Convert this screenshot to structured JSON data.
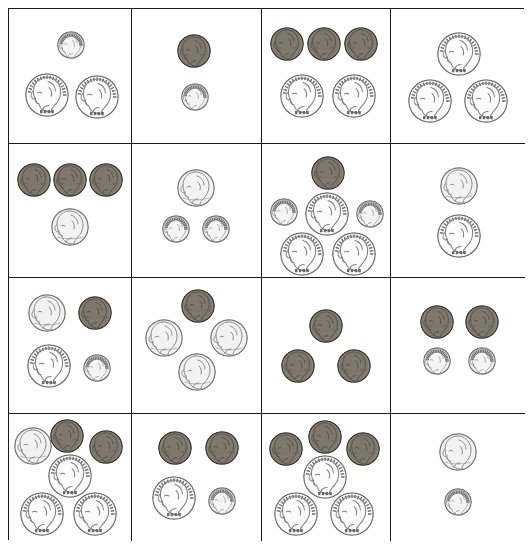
{
  "page": {
    "grid": {
      "rows": 4,
      "cols": 4
    }
  },
  "colors": {
    "border": "#1a1a1a",
    "background": "#ffffff",
    "quarter_face": "#fbfbfb",
    "quarter_edge": "#6b6b6b",
    "nickel_face": "#f2f2f2",
    "nickel_edge": "#6e6e6e",
    "dime_face": "#f4f4f4",
    "dime_edge": "#707070",
    "penny_face": "#8a8378",
    "penny_edge": "#3a362f",
    "relief": "#9a9a9a"
  },
  "coin_types": {
    "quarter": {
      "label": "quarter",
      "value_cents": 25,
      "diameter_px": 44,
      "portrait": "Washington",
      "edge": "reeded"
    },
    "nickel": {
      "label": "nickel",
      "value_cents": 5,
      "diameter_px": 38,
      "portrait": "Jefferson",
      "edge": "smooth"
    },
    "penny": {
      "label": "penny",
      "value_cents": 1,
      "diameter_px": 34,
      "portrait": "Lincoln",
      "edge": "smooth"
    },
    "dime": {
      "label": "dime",
      "value_cents": 10,
      "diameter_px": 28,
      "portrait": "Roosevelt",
      "edge": "reeded"
    }
  },
  "cells": [
    {
      "row": 1,
      "col": 1,
      "name": "cell-r1c1",
      "total_cents": 60,
      "coins": [
        {
          "type": "dime",
          "x": 62,
          "y": 36
        },
        {
          "type": "quarter",
          "x": 38,
          "y": 86
        },
        {
          "type": "quarter",
          "x": 88,
          "y": 88
        }
      ]
    },
    {
      "row": 1,
      "col": 2,
      "name": "cell-r1c2",
      "total_cents": 11,
      "coins": [
        {
          "type": "penny",
          "x": 62,
          "y": 42
        },
        {
          "type": "dime",
          "x": 63,
          "y": 88
        }
      ]
    },
    {
      "row": 1,
      "col": 3,
      "name": "cell-r1c3",
      "total_cents": 53,
      "coins": [
        {
          "type": "penny",
          "x": 25,
          "y": 35
        },
        {
          "type": "penny",
          "x": 62,
          "y": 35
        },
        {
          "type": "penny",
          "x": 99,
          "y": 35
        },
        {
          "type": "quarter",
          "x": 40,
          "y": 87
        },
        {
          "type": "quarter",
          "x": 92,
          "y": 87
        }
      ]
    },
    {
      "row": 1,
      "col": 4,
      "name": "cell-r1c4",
      "total_cents": 75,
      "coins": [
        {
          "type": "quarter",
          "x": 68,
          "y": 45
        },
        {
          "type": "quarter",
          "x": 39,
          "y": 92
        },
        {
          "type": "quarter",
          "x": 95,
          "y": 92
        }
      ]
    },
    {
      "row": 2,
      "col": 1,
      "name": "cell-r2c1",
      "total_cents": 8,
      "coins": [
        {
          "type": "penny",
          "x": 25,
          "y": 36
        },
        {
          "type": "penny",
          "x": 61,
          "y": 36
        },
        {
          "type": "penny",
          "x": 97,
          "y": 36
        },
        {
          "type": "nickel",
          "x": 61,
          "y": 83
        }
      ]
    },
    {
      "row": 2,
      "col": 2,
      "name": "cell-r2c2",
      "total_cents": 25,
      "coins": [
        {
          "type": "nickel",
          "x": 64,
          "y": 44
        },
        {
          "type": "dime",
          "x": 44,
          "y": 85
        },
        {
          "type": "dime",
          "x": 84,
          "y": 85
        }
      ]
    },
    {
      "row": 2,
      "col": 3,
      "name": "cell-r2c3",
      "total_cents": 96,
      "coins": [
        {
          "type": "penny",
          "x": 66,
          "y": 29
        },
        {
          "type": "dime",
          "x": 22,
          "y": 68
        },
        {
          "type": "quarter",
          "x": 65,
          "y": 70
        },
        {
          "type": "dime",
          "x": 108,
          "y": 70
        },
        {
          "type": "quarter",
          "x": 40,
          "y": 110
        },
        {
          "type": "quarter",
          "x": 92,
          "y": 110
        }
      ]
    },
    {
      "row": 2,
      "col": 4,
      "name": "cell-r2c4",
      "total_cents": 30,
      "coins": [
        {
          "type": "nickel",
          "x": 68,
          "y": 42
        },
        {
          "type": "quarter",
          "x": 68,
          "y": 92
        }
      ]
    },
    {
      "row": 3,
      "col": 1,
      "name": "cell-r3c1",
      "total_cents": 41,
      "coins": [
        {
          "type": "nickel",
          "x": 38,
          "y": 35
        },
        {
          "type": "penny",
          "x": 86,
          "y": 35
        },
        {
          "type": "quarter",
          "x": 40,
          "y": 88
        },
        {
          "type": "dime",
          "x": 88,
          "y": 90
        }
      ]
    },
    {
      "row": 3,
      "col": 2,
      "name": "cell-r3c2",
      "total_cents": 16,
      "coins": [
        {
          "type": "penny",
          "x": 66,
          "y": 28
        },
        {
          "type": "nickel",
          "x": 32,
          "y": 60
        },
        {
          "type": "nickel",
          "x": 97,
          "y": 60
        },
        {
          "type": "nickel",
          "x": 65,
          "y": 94
        }
      ]
    },
    {
      "row": 3,
      "col": 3,
      "name": "cell-r3c3",
      "total_cents": 3,
      "coins": [
        {
          "type": "penny",
          "x": 64,
          "y": 48
        },
        {
          "type": "penny",
          "x": 36,
          "y": 88
        },
        {
          "type": "penny",
          "x": 92,
          "y": 88
        }
      ]
    },
    {
      "row": 3,
      "col": 4,
      "name": "cell-r3c4",
      "total_cents": 22,
      "coins": [
        {
          "type": "penny",
          "x": 46,
          "y": 44
        },
        {
          "type": "penny",
          "x": 91,
          "y": 44
        },
        {
          "type": "dime",
          "x": 46,
          "y": 83
        },
        {
          "type": "dime",
          "x": 91,
          "y": 83
        }
      ]
    },
    {
      "row": 4,
      "col": 1,
      "name": "cell-r4c1",
      "total_cents": 82,
      "coins": [
        {
          "type": "nickel",
          "x": 24,
          "y": 32
        },
        {
          "type": "penny",
          "x": 58,
          "y": 22
        },
        {
          "type": "penny",
          "x": 97,
          "y": 33
        },
        {
          "type": "quarter",
          "x": 61,
          "y": 62
        },
        {
          "type": "quarter",
          "x": 33,
          "y": 100
        },
        {
          "type": "quarter",
          "x": 86,
          "y": 100
        }
      ]
    },
    {
      "row": 4,
      "col": 2,
      "name": "cell-r4c2",
      "total_cents": 37,
      "coins": [
        {
          "type": "penny",
          "x": 43,
          "y": 34
        },
        {
          "type": "penny",
          "x": 90,
          "y": 34
        },
        {
          "type": "quarter",
          "x": 42,
          "y": 84
        },
        {
          "type": "dime",
          "x": 90,
          "y": 87
        }
      ]
    },
    {
      "row": 4,
      "col": 3,
      "name": "cell-r4c3",
      "total_cents": 78,
      "coins": [
        {
          "type": "penny",
          "x": 24,
          "y": 35
        },
        {
          "type": "penny",
          "x": 63,
          "y": 23
        },
        {
          "type": "penny",
          "x": 101,
          "y": 35
        },
        {
          "type": "quarter",
          "x": 63,
          "y": 63
        },
        {
          "type": "quarter",
          "x": 34,
          "y": 100
        },
        {
          "type": "quarter",
          "x": 90,
          "y": 100
        }
      ]
    },
    {
      "row": 4,
      "col": 4,
      "name": "cell-r4c4",
      "total_cents": 15,
      "coins": [
        {
          "type": "nickel",
          "x": 67,
          "y": 38
        },
        {
          "type": "dime",
          "x": 67,
          "y": 88
        }
      ]
    }
  ]
}
